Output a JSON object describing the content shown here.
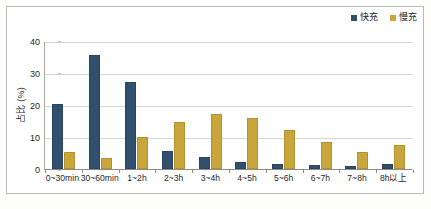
{
  "chart_data": {
    "type": "bar",
    "title": "",
    "subtitle": "",
    "xlabel": "",
    "ylabel": "占比 (%)",
    "ylim": [
      0,
      40
    ],
    "yticks": [
      0,
      10,
      20,
      30,
      40
    ],
    "grid": true,
    "legend_position": "top-right",
    "categories": [
      "0~30min",
      "30~60min",
      "1~2h",
      "2~3h",
      "3~4h",
      "4~5h",
      "5~6h",
      "6~7h",
      "7~8h",
      "8h以上"
    ],
    "series": [
      {
        "name": "快充",
        "color": "#31506E",
        "values": [
          20.3,
          35.6,
          27.2,
          5.5,
          3.6,
          2.2,
          1.7,
          1.2,
          0.8,
          1.7
        ]
      },
      {
        "name": "慢充",
        "color": "#C9A63B",
        "values": [
          5.2,
          3.3,
          10.1,
          14.7,
          17.1,
          16.0,
          12.2,
          8.3,
          5.3,
          7.6
        ]
      }
    ]
  },
  "legend": {
    "entries": [
      {
        "label": "快充",
        "color": "#31506E"
      },
      {
        "label": "慢充",
        "color": "#C9A63B"
      }
    ]
  },
  "axes": {
    "y_title": "占比 (%)",
    "y_tick_labels": [
      "40",
      "30",
      "20",
      "10",
      "0"
    ],
    "x_tick_labels": [
      "0~30min",
      "30~60min",
      "1~2h",
      "2~3h",
      "3~4h",
      "4~5h",
      "5~6h",
      "6~7h",
      "7~8h",
      "8h以上"
    ]
  }
}
